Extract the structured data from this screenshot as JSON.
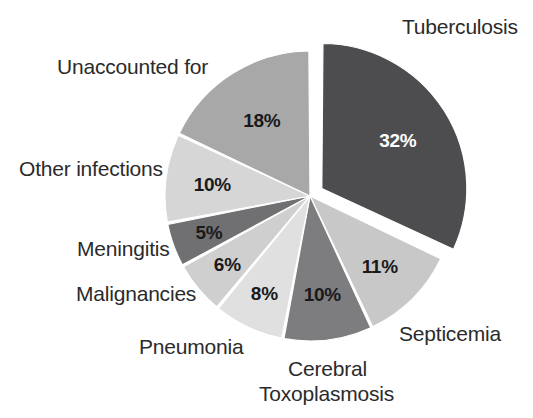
{
  "chart_data": {
    "type": "pie",
    "title": "",
    "subtitle": "",
    "xlabel": "",
    "ylabel": "",
    "legend_position": "none",
    "grid": false,
    "unit": "%",
    "categories": [
      "Tuberculosis",
      "Septicemia",
      "Cerebral Toxoplasmosis",
      "Pneumonia",
      "Malignancies",
      "Meningitis",
      "Other infections",
      "Unaccounted for"
    ],
    "values": [
      32,
      11,
      10,
      8,
      6,
      5,
      10,
      18
    ],
    "slices": [
      {
        "label": "Tuberculosis",
        "label_lines": [
          "Tuberculosis"
        ],
        "value": 32,
        "value_text": "32%",
        "color": "#4d4d4f",
        "value_text_color": "#ffffff",
        "exploded": true
      },
      {
        "label": "Septicemia",
        "label_lines": [
          "Septicemia"
        ],
        "value": 11,
        "value_text": "11%",
        "color": "#c8c8c8",
        "value_text_color": "#1a1a1a",
        "exploded": false
      },
      {
        "label": "Cerebral Toxoplasmosis",
        "label_lines": [
          "Cerebral",
          "Toxoplasmosis"
        ],
        "value": 10,
        "value_text": "10%",
        "color": "#7d7d80",
        "value_text_color": "#1a1a1a",
        "exploded": false
      },
      {
        "label": "Pneumonia",
        "label_lines": [
          "Pneumonia"
        ],
        "value": 8,
        "value_text": "8%",
        "color": "#e0e0e0",
        "value_text_color": "#1a1a1a",
        "exploded": false
      },
      {
        "label": "Malignancies",
        "label_lines": [
          "Malignancies"
        ],
        "value": 6,
        "value_text": "6%",
        "color": "#cfcfcf",
        "value_text_color": "#1a1a1a",
        "exploded": false
      },
      {
        "label": "Meningitis",
        "label_lines": [
          "Meningitis"
        ],
        "value": 5,
        "value_text": "5%",
        "color": "#707073",
        "value_text_color": "#1a1a1a",
        "exploded": false
      },
      {
        "label": "Other infections",
        "label_lines": [
          "Other infections"
        ],
        "value": 10,
        "value_text": "10%",
        "color": "#d6d6d6",
        "value_text_color": "#1a1a1a",
        "exploded": false
      },
      {
        "label": "Unaccounted for",
        "label_lines": [
          "Unaccounted for"
        ],
        "value": 18,
        "value_text": "18%",
        "color": "#a8a8a8",
        "value_text_color": "#1a1a1a",
        "exploded": false
      }
    ]
  },
  "labels": {
    "tuberculosis": "Tuberculosis",
    "unaccounted_for": "Unaccounted for",
    "other_infections": "Other infections",
    "meningitis": "Meningitis",
    "malignancies": "Malignancies",
    "pneumonia": "Pneumonia",
    "cerebral": "Cerebral",
    "toxoplasmosis": "Toxoplasmosis",
    "septicemia": "Septicemia"
  },
  "percent_labels": {
    "tuberculosis": "32%",
    "septicemia": "11%",
    "cerebral_toxoplasmosis": "10%",
    "pneumonia": "8%",
    "malignancies": "6%",
    "meningitis": "5%",
    "other_infections": "10%",
    "unaccounted_for": "18%"
  },
  "colors": {
    "background": "#ffffff",
    "text": "#2b2b2b",
    "slice_separator": "#ffffff"
  }
}
